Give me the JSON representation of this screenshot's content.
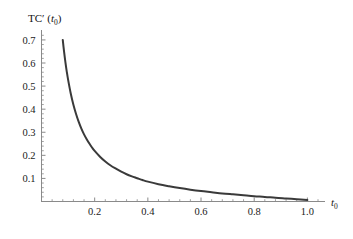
{
  "chart_data": {
    "type": "line",
    "title": "",
    "subtitle": "",
    "ylabel": "TC′ (t₀)",
    "ylabel_parts": {
      "main": "TC′ (",
      "var": "t",
      "sub": "0",
      "close": ")"
    },
    "xlabel": "t₀",
    "xlabel_parts": {
      "var": "t",
      "sub": "0"
    },
    "xlim": [
      0.0,
      1.04
    ],
    "ylim": [
      0.0,
      0.73
    ],
    "xticks": [
      0.2,
      0.4,
      0.6,
      0.8,
      1.0
    ],
    "xtick_labels": [
      "0.2",
      "0.4",
      "0.6",
      "0.8",
      "1.0"
    ],
    "yticks": [
      0.1,
      0.2,
      0.3,
      0.4,
      0.5,
      0.6,
      0.7
    ],
    "ytick_labels": [
      "0.1",
      "0.2",
      "0.3",
      "0.4",
      "0.5",
      "0.6",
      "0.7"
    ],
    "grid": false,
    "legend": null,
    "legend_position": "none",
    "series": [
      {
        "name": "TC'(t0)",
        "color": "#3a3a3a",
        "linewidth": 2.0,
        "x": [
          0.08,
          0.085,
          0.09,
          0.095,
          0.1,
          0.11,
          0.12,
          0.13,
          0.14,
          0.15,
          0.16,
          0.17,
          0.18,
          0.19,
          0.2,
          0.22,
          0.24,
          0.26,
          0.28,
          0.3,
          0.32,
          0.34,
          0.36,
          0.38,
          0.4,
          0.44,
          0.48,
          0.52,
          0.56,
          0.6,
          0.64,
          0.68,
          0.72,
          0.76,
          0.8,
          0.84,
          0.88,
          0.92,
          0.96,
          1.0
        ],
        "y": [
          0.7,
          0.648,
          0.603,
          0.563,
          0.528,
          0.468,
          0.419,
          0.379,
          0.345,
          0.316,
          0.291,
          0.27,
          0.251,
          0.234,
          0.219,
          0.194,
          0.173,
          0.156,
          0.142,
          0.129,
          0.118,
          0.109,
          0.101,
          0.093,
          0.086,
          0.075,
          0.066,
          0.058,
          0.051,
          0.045,
          0.04,
          0.035,
          0.031,
          0.027,
          0.023,
          0.02,
          0.016,
          0.013,
          0.01,
          0.007
        ]
      }
    ],
    "annotations": []
  },
  "axes_style": {
    "axis_color": "#8a8a8a",
    "tick_color": "#8a8a8a",
    "text_color": "#111111",
    "background": "#ffffff"
  }
}
